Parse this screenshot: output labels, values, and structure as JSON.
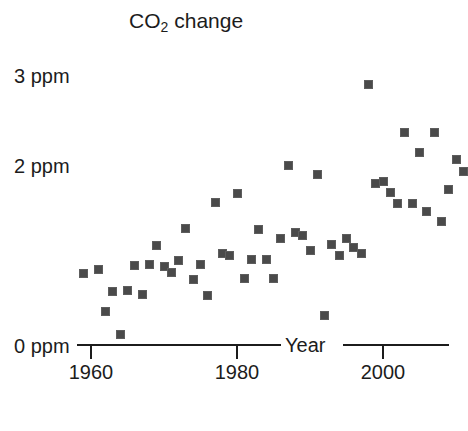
{
  "chart_data": {
    "type": "scatter",
    "title": "CO2 change",
    "title_parts": {
      "pre": "CO",
      "sub": "2",
      "post": " change"
    },
    "xlabel": "Year",
    "ylabel": "",
    "unit": "ppm",
    "xlim": [
      1956,
      2013
    ],
    "ylim": [
      0,
      3.15
    ],
    "grid": false,
    "legend": null,
    "xticks": [
      1960,
      1980,
      2000
    ],
    "xtick_labels": [
      "1960",
      "1980",
      "2000"
    ],
    "yticks": [
      0,
      2,
      3
    ],
    "ytick_labels": [
      "0 ppm",
      "2 ppm",
      "3 ppm"
    ],
    "marker": {
      "shape": "square",
      "color": "#4a4a4a",
      "edge_color": "#5d5d5d",
      "size_px": 9
    },
    "axis_color": "#1c1c1c",
    "background": "#ffffff",
    "points": [
      {
        "x": 1959,
        "y": 0.8
      },
      {
        "x": 1961,
        "y": 0.84
      },
      {
        "x": 1962,
        "y": 0.37
      },
      {
        "x": 1963,
        "y": 0.59
      },
      {
        "x": 1964,
        "y": 0.12
      },
      {
        "x": 1965,
        "y": 0.61
      },
      {
        "x": 1966,
        "y": 0.88
      },
      {
        "x": 1967,
        "y": 0.56
      },
      {
        "x": 1968,
        "y": 0.89
      },
      {
        "x": 1969,
        "y": 1.11
      },
      {
        "x": 1970,
        "y": 0.87
      },
      {
        "x": 1971,
        "y": 0.81
      },
      {
        "x": 1972,
        "y": 0.94
      },
      {
        "x": 1973,
        "y": 1.3
      },
      {
        "x": 1974,
        "y": 0.73
      },
      {
        "x": 1975,
        "y": 0.9
      },
      {
        "x": 1976,
        "y": 0.55
      },
      {
        "x": 1977,
        "y": 1.58
      },
      {
        "x": 1978,
        "y": 1.02
      },
      {
        "x": 1979,
        "y": 1.0
      },
      {
        "x": 1980,
        "y": 1.68
      },
      {
        "x": 1981,
        "y": 0.74
      },
      {
        "x": 1982,
        "y": 0.95
      },
      {
        "x": 1983,
        "y": 1.28
      },
      {
        "x": 1984,
        "y": 0.95
      },
      {
        "x": 1985,
        "y": 0.74
      },
      {
        "x": 1986,
        "y": 1.18
      },
      {
        "x": 1987,
        "y": 2.0
      },
      {
        "x": 1988,
        "y": 1.25
      },
      {
        "x": 1989,
        "y": 1.22
      },
      {
        "x": 1990,
        "y": 1.05
      },
      {
        "x": 1991,
        "y": 1.9
      },
      {
        "x": 1992,
        "y": 0.33
      },
      {
        "x": 1993,
        "y": 1.12
      },
      {
        "x": 1994,
        "y": 1.0
      },
      {
        "x": 1995,
        "y": 1.18
      },
      {
        "x": 1996,
        "y": 1.08
      },
      {
        "x": 1997,
        "y": 1.02
      },
      {
        "x": 1998,
        "y": 2.9
      },
      {
        "x": 1999,
        "y": 1.8
      },
      {
        "x": 2000,
        "y": 1.82
      },
      {
        "x": 2001,
        "y": 1.7
      },
      {
        "x": 2002,
        "y": 1.57
      },
      {
        "x": 2003,
        "y": 2.36
      },
      {
        "x": 2004,
        "y": 1.57
      },
      {
        "x": 2005,
        "y": 2.14
      },
      {
        "x": 2006,
        "y": 1.48
      },
      {
        "x": 2007,
        "y": 2.36
      },
      {
        "x": 2008,
        "y": 1.37
      },
      {
        "x": 2009,
        "y": 1.73
      },
      {
        "x": 2010,
        "y": 2.06
      },
      {
        "x": 2011,
        "y": 1.93
      }
    ]
  }
}
